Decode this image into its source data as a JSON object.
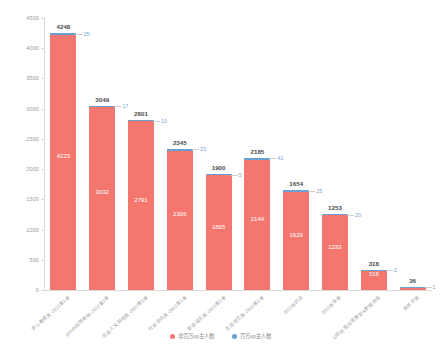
{
  "chart_data": {
    "type": "bar",
    "stacked": true,
    "title": "",
    "xlabel": "",
    "ylabel": "",
    "ylim": [
      0,
      4500
    ],
    "yticks": [
      0,
      500,
      1000,
      1500,
      2000,
      2500,
      3000,
      3500,
      4000,
      4500
    ],
    "grid": false,
    "legend_position": "bottom",
    "categories": [
      "学习教育类-2022第1季",
      "goods科技数码-2022第1季",
      "历史人文财经类-2022第1季",
      "社会资讯类-2022第1季",
      "影视娱乐类-2022第1季",
      "生活综艺类-2022第1季",
      "2022年四月",
      "2022年末季",
      "公司运营内容策划&新媒体类",
      "其他分类"
    ],
    "series": [
      {
        "name": "非百万up主人数",
        "color": "#f4776f",
        "values": [
          4223,
          3032,
          2791,
          2306,
          1895,
          2144,
          1629,
          1233,
          316,
          35
        ]
      },
      {
        "name": "百万up主人数",
        "color": "#6b9fd2",
        "values": [
          25,
          17,
          10,
          33,
          5,
          41,
          25,
          20,
          2,
          1
        ]
      }
    ],
    "totals": [
      4248,
      3049,
      2801,
      2345,
      1900,
      2185,
      1654,
      1253,
      318,
      36
    ]
  },
  "legend": {
    "items": [
      {
        "label": "非百万up主人数",
        "color": "#f4776f"
      },
      {
        "label": "百万up主人数",
        "color": "#6b9fd2"
      }
    ]
  }
}
